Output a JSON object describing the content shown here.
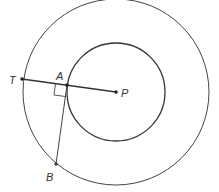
{
  "diagram": {
    "points": {
      "T": {
        "label": "T",
        "x": 22,
        "y": 79
      },
      "A": {
        "label": "A",
        "x": 67,
        "y": 85
      },
      "P": {
        "label": "P",
        "x": 116,
        "y": 92
      },
      "B": {
        "label": "B",
        "x": 56,
        "y": 164
      }
    },
    "outer_circle": {
      "cx": 116,
      "cy": 92,
      "r": 94
    },
    "inner_circle": {
      "cx": 116,
      "cy": 92,
      "r": 49
    },
    "segments": [
      "TP",
      "AB"
    ],
    "right_angle_at": "A",
    "colors": {
      "stroke": "#333333",
      "background": "#ffffff"
    }
  }
}
